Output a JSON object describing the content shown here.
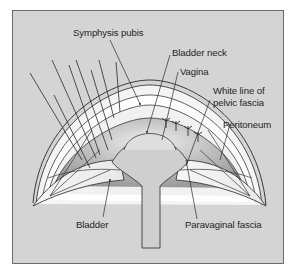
{
  "figure": {
    "background_color": "#d4d4d4",
    "border_color": "#6a6a6a",
    "labels": {
      "symphysis_pubis": "Symphysis pubis",
      "bladder_neck": "Bladder neck",
      "vagina": "Vagina",
      "white_line_1": "White line of",
      "white_line_2": "pelvic fascia",
      "peritoneum": "Peritoneum",
      "bladder": "Bladder",
      "paravaginal_fascia": "Paravaginal fascia"
    }
  }
}
